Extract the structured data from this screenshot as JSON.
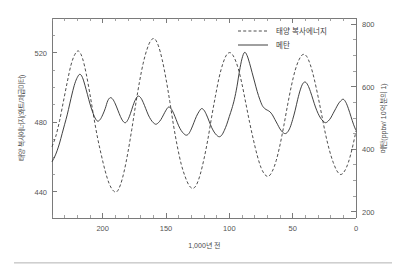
{
  "chart_data": {
    "type": "line",
    "title": "",
    "xlabel": "1,000년 전",
    "ylabel": "태양 복사에너지(와트/제곱미터)",
    "y2label": "메탄(ppbv/ 10억 분의 1)",
    "xlim": [
      240,
      0
    ],
    "xlim_note": "시간은 오른쪽으로 갈수록 현재에 가까워짐",
    "ylim": [
      425,
      540
    ],
    "y2lim": [
      180,
      820
    ],
    "xticks": [
      200,
      150,
      100,
      50,
      0
    ],
    "xticklabels": [
      "200",
      "150",
      "100",
      "50",
      "0"
    ],
    "xminor_step": 10,
    "yticks": [
      440,
      480,
      520
    ],
    "yticklabels": [
      "440",
      "480",
      "520"
    ],
    "y2ticks": [
      200,
      400,
      600,
      800
    ],
    "y2ticklabels": [
      "200",
      "400",
      "600",
      "800"
    ],
    "grid": false,
    "legend_position": "top-right",
    "series": [
      {
        "name": "태양 복사에너지",
        "axis": "left",
        "style": "dashed",
        "color": "#3a3a3a",
        "x": [
          240,
          237,
          234,
          231,
          228,
          225,
          222,
          219,
          216,
          213,
          210,
          207,
          204,
          201,
          198,
          195,
          192,
          189,
          186,
          183,
          180,
          177,
          174,
          171,
          168,
          165,
          162,
          159,
          156,
          153,
          150,
          147,
          144,
          141,
          138,
          135,
          132,
          129,
          126,
          123,
          120,
          117,
          114,
          111,
          108,
          105,
          102,
          99,
          96,
          93,
          90,
          87,
          84,
          81,
          78,
          75,
          72,
          69,
          66,
          63,
          60,
          57,
          54,
          51,
          48,
          45,
          42,
          39,
          36,
          33,
          30,
          27,
          24,
          21,
          18,
          15,
          12,
          9,
          6,
          3,
          0
        ],
        "y": [
          466,
          472,
          481,
          492,
          503,
          513,
          519,
          521,
          517,
          508,
          496,
          483,
          471,
          461,
          452,
          445,
          441,
          440,
          444,
          452,
          463,
          476,
          490,
          503,
          514,
          522,
          527,
          528,
          524,
          516,
          505,
          492,
          478,
          466,
          456,
          449,
          444,
          442,
          444,
          450,
          459,
          470,
          483,
          495,
          506,
          514,
          519,
          520,
          517,
          511,
          502,
          491,
          480,
          470,
          461,
          454,
          450,
          449,
          452,
          458,
          467,
          478,
          490,
          501,
          510,
          516,
          519,
          518,
          513,
          505,
          495,
          484,
          473,
          464,
          457,
          452,
          450,
          452,
          457,
          465,
          475
        ]
      },
      {
        "name": "메탄",
        "axis": "right",
        "style": "solid",
        "color": "#2b2b2b",
        "x": [
          240,
          238,
          236,
          234,
          232,
          230,
          228,
          226,
          224,
          222,
          220,
          218,
          216,
          214,
          212,
          210,
          208,
          206,
          204,
          202,
          200,
          198,
          196,
          194,
          192,
          190,
          188,
          186,
          184,
          182,
          180,
          178,
          176,
          174,
          172,
          170,
          168,
          166,
          164,
          162,
          160,
          158,
          156,
          154,
          152,
          150,
          148,
          146,
          144,
          142,
          140,
          138,
          136,
          134,
          132,
          130,
          128,
          126,
          124,
          122,
          120,
          118,
          116,
          114,
          112,
          110,
          108,
          106,
          104,
          102,
          100,
          98,
          96,
          94,
          92,
          90,
          88,
          86,
          84,
          82,
          80,
          78,
          76,
          74,
          72,
          70,
          68,
          66,
          64,
          62,
          60,
          58,
          56,
          54,
          52,
          50,
          48,
          46,
          44,
          42,
          40,
          38,
          36,
          34,
          32,
          30,
          28,
          26,
          24,
          22,
          20,
          18,
          16,
          14,
          12,
          10,
          8,
          6,
          4,
          2,
          0
        ],
        "y": [
          360,
          375,
          395,
          420,
          450,
          480,
          510,
          545,
          580,
          610,
          630,
          640,
          630,
          605,
          575,
          545,
          520,
          500,
          490,
          495,
          510,
          530,
          555,
          565,
          560,
          545,
          525,
          505,
          490,
          485,
          495,
          515,
          540,
          560,
          570,
          565,
          550,
          530,
          510,
          495,
          485,
          480,
          485,
          495,
          510,
          525,
          535,
          530,
          515,
          495,
          475,
          460,
          450,
          445,
          450,
          465,
          485,
          505,
          520,
          530,
          525,
          510,
          490,
          470,
          455,
          445,
          440,
          445,
          460,
          480,
          505,
          530,
          560,
          600,
          650,
          690,
          710,
          700,
          675,
          645,
          615,
          585,
          560,
          540,
          530,
          525,
          520,
          510,
          495,
          480,
          465,
          455,
          450,
          455,
          470,
          495,
          525,
          560,
          590,
          610,
          615,
          605,
          585,
          560,
          535,
          515,
          500,
          490,
          485,
          490,
          500,
          515,
          530,
          545,
          555,
          560,
          550,
          530,
          505,
          480,
          460
        ]
      }
    ],
    "annotations": []
  },
  "legend": {
    "items": [
      {
        "label": "태양 복사에너지",
        "style": "dashed"
      },
      {
        "label": "메탄",
        "style": "solid"
      }
    ]
  }
}
